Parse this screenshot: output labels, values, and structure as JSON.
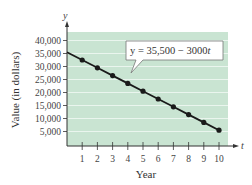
{
  "chart_data": {
    "type": "line",
    "title": "",
    "xlabel": "Year",
    "ylabel": "Value (in dollars)",
    "x_axis_variable": "t",
    "y_axis_variable": "y",
    "x": [
      0,
      1,
      2,
      3,
      4,
      5,
      6,
      7,
      8,
      9,
      10
    ],
    "series": [
      {
        "name": "y = 35,500 − 3000t",
        "values": [
          35500,
          32500,
          29500,
          26500,
          23500,
          20500,
          17500,
          14500,
          11500,
          8500,
          5500
        ],
        "markers_at_x": [
          1,
          2,
          3,
          4,
          5,
          6,
          7,
          8,
          9,
          10
        ]
      }
    ],
    "x_ticks": [
      "1",
      "2",
      "3",
      "4",
      "5",
      "6",
      "7",
      "8",
      "9",
      "10"
    ],
    "y_ticks": [
      "5,000",
      "10,000",
      "15,000",
      "20,000",
      "25,000",
      "30,000",
      "35,000",
      "40,000"
    ],
    "y_tick_values": [
      5000,
      10000,
      15000,
      20000,
      25000,
      30000,
      35000,
      40000
    ],
    "xlim": [
      0,
      10.6
    ],
    "ylim": [
      0,
      43000
    ],
    "grid": "horizontal",
    "annotation": {
      "text": "y = 35,500 − 3000t",
      "points_to_x": 4
    },
    "colors": {
      "plot_background": "#c9e4d2",
      "grid": "#eaf5ee",
      "line": "#1a1a1a",
      "marker": "#1a1a1a"
    }
  },
  "labels": {
    "y_axis_var": "y",
    "x_axis_var": "t",
    "ylabel": "Value (in dollars)",
    "xlabel": "Year",
    "equation_prefix": "y = 35,500 − 3000",
    "equation_var": "t"
  }
}
